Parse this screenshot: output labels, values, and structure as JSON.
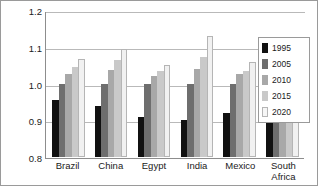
{
  "chart_data": {
    "type": "bar",
    "title": "",
    "xlabel": "",
    "ylabel": "",
    "ylim": [
      0.8,
      1.2
    ],
    "yticks": [
      "0.8",
      "0.9",
      "1.0",
      "1.1",
      "1.2"
    ],
    "grid": true,
    "legend_position": "right",
    "categories": [
      "Brazil",
      "China",
      "Egypt",
      "India",
      "Mexico",
      "South Africa"
    ],
    "series": [
      {
        "name": "1995",
        "color": "#111111",
        "values": [
          0.955,
          0.94,
          0.91,
          0.9,
          0.92,
          0.993
        ]
      },
      {
        "name": "2005",
        "color": "#6e6e6e",
        "values": [
          1.0,
          1.0,
          1.0,
          1.0,
          1.0,
          1.008
        ]
      },
      {
        "name": "2010",
        "color": "#a8a8a8",
        "values": [
          1.025,
          1.037,
          1.02,
          1.04,
          1.027,
          1.033
        ]
      },
      {
        "name": "2015",
        "color": "#c9c9c9",
        "values": [
          1.045,
          1.063,
          1.033,
          1.072,
          1.035,
          1.05
        ]
      },
      {
        "name": "2020",
        "color": "#f1f1f1",
        "values": [
          1.068,
          1.095,
          1.05,
          1.128,
          1.058,
          1.072
        ]
      }
    ]
  }
}
